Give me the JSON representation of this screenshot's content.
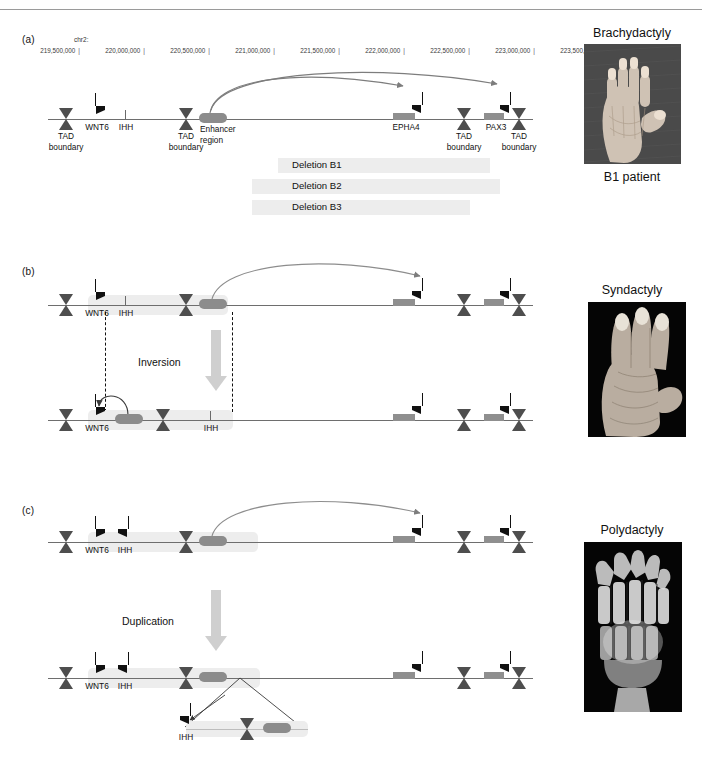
{
  "figure": {
    "panels": [
      {
        "id": "a",
        "label": "(a)"
      },
      {
        "id": "b",
        "label": "(b)"
      },
      {
        "id": "c",
        "label": "(c)"
      }
    ]
  },
  "ruler": {
    "chromosome": "chr2:",
    "ticks": [
      "219,500,000",
      "220,000,000",
      "220,500,000",
      "221,000,000",
      "221,500,000",
      "222,000,000",
      "222,500,000",
      "223,000,000",
      "223,500,000"
    ],
    "tick_glyph": "|"
  },
  "panel_a": {
    "genes": {
      "wnt6": "WNT6",
      "ihh": "IHH",
      "epha4": "EPHA4",
      "pax3": "PAX3"
    },
    "enhancer_label_line1": "Enhancer",
    "enhancer_label_line2": "region",
    "tad_label_line1": "TAD",
    "tad_label_line2": "boundary",
    "deletions": [
      "Deletion B1",
      "Deletion B2",
      "Deletion B3"
    ]
  },
  "panel_b": {
    "genes": {
      "wnt6": "WNT6",
      "ihh": "IHH"
    },
    "process": "Inversion"
  },
  "panel_c": {
    "genes": {
      "wnt6": "WNT6",
      "ihh": "IHH",
      "ihh_dup": "IHH"
    },
    "process": "Duplication"
  },
  "photos": [
    {
      "title": "Brachydactyly",
      "caption": "B1 patient",
      "kind": "hand-photo"
    },
    {
      "title": "Syndactyly",
      "caption": "",
      "kind": "hand-photo"
    },
    {
      "title": "Polydactyly",
      "caption": "",
      "kind": "xray-photo"
    }
  ],
  "colors": {
    "tad_boundary": "#4e4e4e",
    "gene_bar": "#8f8f8f",
    "enhancer": "#8c8c8c",
    "shade": "#ededed",
    "arrow": "#cfcfcf",
    "line": "#6e6e6e"
  }
}
